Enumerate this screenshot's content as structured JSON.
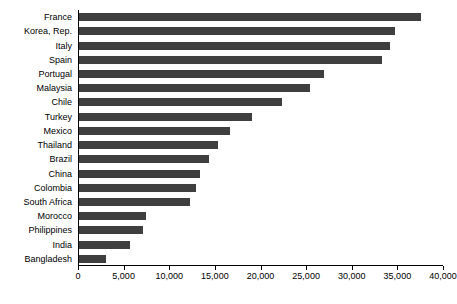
{
  "chart_data": {
    "type": "bar",
    "orientation": "horizontal",
    "title": "",
    "subtitle": "",
    "xlabel": "",
    "ylabel": "",
    "grid": false,
    "legend": null,
    "xlim": [
      0,
      40000
    ],
    "xticks": [
      0,
      5000,
      10000,
      15000,
      20000,
      25000,
      30000,
      35000,
      40000
    ],
    "xtick_labels": [
      "0",
      "5,000",
      "10,000",
      "15,000",
      "20,000",
      "25,000",
      "30,000",
      "35,000",
      "40,000"
    ],
    "bar_color": "#3f3f3f",
    "categories": [
      "France",
      "Korea, Rep.",
      "Italy",
      "Spain",
      "Portugal",
      "Malaysia",
      "Chile",
      "Turkey",
      "Mexico",
      "Thailand",
      "Brazil",
      "China",
      "Colombia",
      "South Africa",
      "Morocco",
      "Philippines",
      "India",
      "Bangladesh"
    ],
    "values": [
      37500,
      34600,
      34100,
      33200,
      26800,
      25300,
      22200,
      19000,
      16600,
      15200,
      14300,
      13300,
      12800,
      12200,
      7300,
      7000,
      5600,
      3000
    ]
  }
}
